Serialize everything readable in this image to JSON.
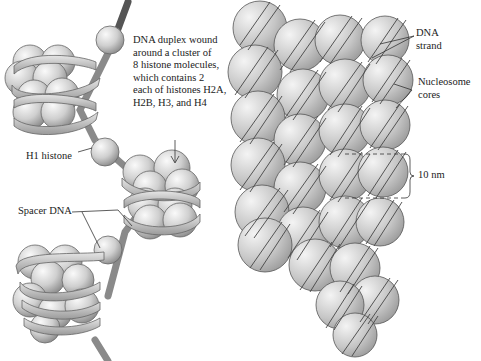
{
  "figure": {
    "left_panel": {
      "callout_main": {
        "lines": [
          "DNA duplex wound",
          "around a cluster of",
          "8 histone molecules,",
          "which contains 2",
          "each of histones H2A,",
          "H2B, H3, and H4"
        ]
      },
      "label_h1": "H1 histone",
      "label_spacer": "Spacer DNA"
    },
    "right_panel": {
      "label_dna_strand": [
        "DNA",
        "strand"
      ],
      "label_nucleosome_cores": [
        "Nucleosome",
        "cores"
      ],
      "label_scale": "10 nm"
    }
  },
  "colors": {
    "sphere_light": "#f2f2f2",
    "sphere_dark": "#8a8a8a",
    "outline": "#555555",
    "text": "#222222",
    "background": "#ffffff"
  }
}
